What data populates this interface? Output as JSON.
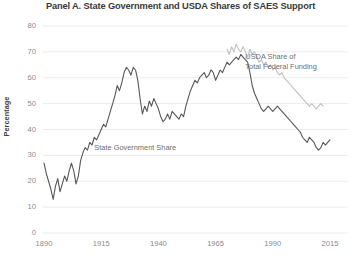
{
  "chart_data": {
    "type": "line",
    "title": "Panel A. State Government and USDA Shares of SAES Support",
    "xlabel": "",
    "ylabel": "Percentage",
    "xlim": [
      1888,
      2017
    ],
    "ylim": [
      0,
      80
    ],
    "xticks": [
      "1890",
      "1915",
      "1940",
      "1965",
      "1990",
      "2015"
    ],
    "xtick_values": [
      1890,
      1915,
      1940,
      1965,
      1990,
      2015
    ],
    "yticks": [
      "0",
      "10",
      "20",
      "30",
      "40",
      "50",
      "60",
      "70",
      "80"
    ],
    "ytick_values": [
      0,
      10,
      20,
      30,
      40,
      50,
      60,
      70,
      80
    ],
    "grid": "horizontal",
    "legend_position": "inline-annotation",
    "colors": {
      "state_government_share": "#575757",
      "usda_share": "#bfbfbf",
      "gridline": "#ececec",
      "tick_text": "#8b8b8b",
      "title_text": "#3a3a3a",
      "label_text": "#6e6e6e",
      "background": "#ffffff"
    },
    "series": [
      {
        "name": "State Government Share",
        "label": "State Government Share",
        "color": "#575757",
        "label_x": 1912,
        "label_y": 33,
        "x": [
          1890,
          1891,
          1892,
          1893,
          1894,
          1895,
          1896,
          1897,
          1898,
          1899,
          1900,
          1901,
          1902,
          1903,
          1904,
          1905,
          1906,
          1907,
          1908,
          1909,
          1910,
          1911,
          1912,
          1913,
          1914,
          1915,
          1916,
          1917,
          1918,
          1919,
          1920,
          1921,
          1922,
          1923,
          1924,
          1925,
          1926,
          1927,
          1928,
          1929,
          1930,
          1931,
          1932,
          1933,
          1934,
          1935,
          1936,
          1937,
          1938,
          1939,
          1940,
          1941,
          1942,
          1943,
          1944,
          1945,
          1946,
          1947,
          1948,
          1949,
          1950,
          1951,
          1952,
          1953,
          1954,
          1955,
          1956,
          1957,
          1958,
          1959,
          1960,
          1961,
          1962,
          1963,
          1964,
          1965,
          1966,
          1967,
          1968,
          1969,
          1970,
          1971,
          1972,
          1973,
          1974,
          1975,
          1976,
          1977,
          1978,
          1979,
          1980,
          1981,
          1982,
          1983,
          1984,
          1985,
          1986,
          1987,
          1988,
          1989,
          1990,
          1991,
          1992,
          1993,
          1994,
          1995,
          1996,
          1997,
          1998,
          1999,
          2000,
          2001,
          2002,
          2003,
          2004,
          2005,
          2006,
          2007,
          2008,
          2009,
          2010,
          2011,
          2012,
          2013,
          2014,
          2015
        ],
        "values": [
          27,
          23,
          20,
          17,
          13,
          18,
          21,
          16,
          19,
          22,
          20,
          24,
          27,
          24,
          19,
          22,
          28,
          31,
          33,
          32,
          35,
          34,
          37,
          36,
          38,
          40,
          42,
          41,
          44,
          47,
          50,
          53,
          57,
          55,
          58,
          62,
          64,
          63,
          61,
          64,
          63,
          59,
          52,
          46,
          49,
          47,
          51,
          49,
          52,
          50,
          48,
          45,
          43,
          44,
          46,
          44,
          47,
          46,
          45,
          44,
          46,
          45,
          49,
          52,
          55,
          57,
          59,
          58,
          60,
          61,
          62,
          60,
          61,
          63,
          62,
          59,
          61,
          63,
          62,
          64,
          66,
          65,
          66,
          67,
          68,
          67,
          69,
          68,
          67,
          66,
          62,
          57,
          54,
          52,
          50,
          48,
          47,
          48,
          49,
          48,
          47,
          48,
          49,
          48,
          47,
          46,
          45,
          44,
          43,
          42,
          41,
          40,
          39,
          37,
          36,
          35,
          37,
          36,
          35,
          33,
          32,
          33,
          35,
          34,
          35,
          36
        ]
      },
      {
        "name": "USDA Share of Total Federal Funding",
        "label": "USDA Share of\nTotal Federal Funding",
        "color": "#bfbfbf",
        "label_x": 1978,
        "label_y": 68,
        "x": [
          1970,
          1971,
          1972,
          1973,
          1974,
          1975,
          1976,
          1977,
          1978,
          1979,
          1980,
          1981,
          1982,
          1983,
          1984,
          1985,
          1986,
          1987,
          1988,
          1989,
          1990,
          1991,
          1992,
          1993,
          1994,
          1995,
          1996,
          1997,
          1998,
          1999,
          2000,
          2001,
          2002,
          2003,
          2004,
          2005,
          2006,
          2007,
          2008,
          2009,
          2010,
          2011,
          2012
        ],
        "values": [
          71,
          69,
          72,
          70,
          73,
          71,
          70,
          72,
          70,
          68,
          71,
          69,
          70,
          68,
          66,
          67,
          65,
          66,
          64,
          65,
          63,
          64,
          62,
          61,
          62,
          60,
          59,
          58,
          57,
          56,
          55,
          54,
          53,
          52,
          51,
          50,
          49,
          50,
          49,
          48,
          49,
          50,
          49
        ]
      }
    ]
  }
}
